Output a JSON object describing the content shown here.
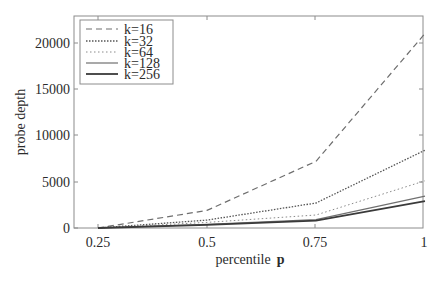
{
  "chart_data": {
    "type": "line",
    "title": "",
    "xlabel": "percentile",
    "xlabel_symbol": "p",
    "ylabel": "probe depth",
    "x": [
      0.25,
      0.5,
      0.75,
      1
    ],
    "x_tick_labels": [
      "0.25",
      "0.5",
      "0.75",
      "1"
    ],
    "y_ticks": [
      0,
      5000,
      10000,
      15000,
      20000
    ],
    "y_tick_labels": [
      "0",
      "5000",
      "10000",
      "15000",
      "20000"
    ],
    "xlim": [
      0.2,
      1
    ],
    "ylim": [
      0,
      21000
    ],
    "grid": false,
    "legend_position": "upper left",
    "series": [
      {
        "name": "k=16",
        "style": "dashed",
        "color": "#6e6e6e",
        "width": 1.2,
        "values": [
          0,
          1900,
          7200,
          21000
        ]
      },
      {
        "name": "k=32",
        "style": "dotted",
        "color": "#555555",
        "width": 1.3,
        "values": [
          0,
          850,
          2700,
          8400
        ]
      },
      {
        "name": "k=64",
        "style": "dotted-light",
        "color": "#8a8a8a",
        "width": 1.0,
        "values": [
          0,
          600,
          1400,
          5100
        ]
      },
      {
        "name": "k=128",
        "style": "solid",
        "color": "#707070",
        "width": 1.2,
        "values": [
          0,
          400,
          900,
          3450
        ]
      },
      {
        "name": "k=256",
        "style": "solid-thick",
        "color": "#3a3a3a",
        "width": 1.8,
        "values": [
          0,
          350,
          800,
          2900
        ]
      }
    ]
  }
}
